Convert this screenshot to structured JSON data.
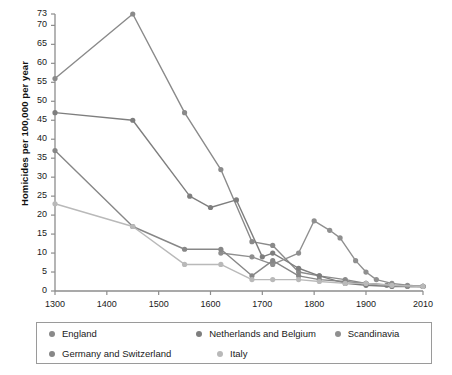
{
  "chart_data": {
    "type": "line",
    "title": "",
    "xlabel": "",
    "ylabel": "Homicides per 100,000 per year",
    "xlim": [
      1300,
      2010
    ],
    "ylim": [
      0,
      73
    ],
    "grid": false,
    "legend_position": "bottom",
    "x_ticks": [
      1300,
      1400,
      1500,
      1600,
      1700,
      1800,
      1900,
      2010
    ],
    "x_tick_labels": [
      "1300",
      "1400",
      "1500",
      "1600",
      "1700",
      "1800",
      "1900",
      "2010"
    ],
    "y_ticks": [
      0,
      5,
      10,
      15,
      20,
      25,
      30,
      35,
      40,
      45,
      50,
      55,
      60,
      65,
      70,
      73
    ],
    "y_tick_labels": [
      "0",
      "5",
      "10",
      "15",
      "20",
      "25",
      "30",
      "35",
      "40",
      "45",
      "50",
      "55",
      "60",
      "65",
      "70",
      "73"
    ],
    "series": [
      {
        "name": "England",
        "color": "#8a8a8a",
        "points": [
          [
            1300,
            56
          ],
          [
            1450,
            73
          ],
          [
            1550,
            47
          ],
          [
            1620,
            32
          ],
          [
            1680,
            13
          ],
          [
            1720,
            12
          ],
          [
            1770,
            5
          ],
          [
            1810,
            4
          ],
          [
            1860,
            3
          ],
          [
            1900,
            2
          ],
          [
            1940,
            1.5
          ],
          [
            1980,
            1.2
          ],
          [
            2010,
            1.2
          ]
        ]
      },
      {
        "name": "Netherlands and Belgium",
        "color": "#7e7e7e",
        "points": [
          [
            1300,
            47
          ],
          [
            1450,
            45
          ],
          [
            1560,
            25
          ],
          [
            1600,
            22
          ],
          [
            1650,
            24
          ],
          [
            1700,
            9
          ],
          [
            1720,
            10
          ],
          [
            1770,
            6
          ],
          [
            1810,
            4
          ],
          [
            1860,
            2
          ],
          [
            1900,
            1.5
          ],
          [
            1950,
            1.2
          ],
          [
            2010,
            1.2
          ]
        ]
      },
      {
        "name": "Scandinavia",
        "color": "#8f8f8f",
        "points": [
          [
            1620,
            10
          ],
          [
            1680,
            9
          ],
          [
            1720,
            7
          ],
          [
            1770,
            10
          ],
          [
            1800,
            18.5
          ],
          [
            1830,
            16
          ],
          [
            1850,
            14
          ],
          [
            1880,
            8
          ],
          [
            1900,
            5
          ],
          [
            1920,
            3
          ],
          [
            1950,
            2
          ],
          [
            1980,
            1.5
          ],
          [
            2010,
            1.2
          ]
        ]
      },
      {
        "name": "Germany and Switzerland",
        "color": "#878787",
        "points": [
          [
            1300,
            37
          ],
          [
            1450,
            17
          ],
          [
            1550,
            11
          ],
          [
            1620,
            11
          ],
          [
            1680,
            4
          ],
          [
            1720,
            8
          ],
          [
            1770,
            4
          ],
          [
            1810,
            3
          ],
          [
            1860,
            2.5
          ],
          [
            1900,
            2
          ],
          [
            1950,
            1.5
          ],
          [
            2010,
            1.2
          ]
        ]
      },
      {
        "name": "Italy",
        "color": "#b9b9b9",
        "points": [
          [
            1300,
            23
          ],
          [
            1450,
            17
          ],
          [
            1550,
            7
          ],
          [
            1620,
            7
          ],
          [
            1680,
            3
          ],
          [
            1720,
            3
          ],
          [
            1770,
            3
          ],
          [
            1810,
            2.5
          ],
          [
            1860,
            2
          ],
          [
            1900,
            2
          ],
          [
            1950,
            1.5
          ],
          [
            2010,
            1.2
          ]
        ]
      }
    ]
  },
  "legend": {
    "rows": [
      [
        {
          "label": "England",
          "color": "#8a8a8a"
        },
        {
          "label": "Netherlands and Belgium",
          "color": "#7e7e7e"
        },
        {
          "label": "Scandinavia",
          "color": "#8f8f8f"
        }
      ],
      [
        {
          "label": "Germany and Switzerland",
          "color": "#878787"
        },
        {
          "label": "Italy",
          "color": "#b9b9b9"
        }
      ]
    ]
  }
}
